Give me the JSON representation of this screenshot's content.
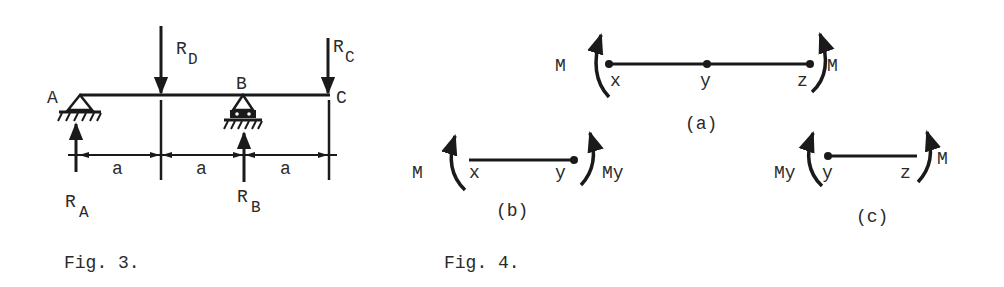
{
  "figure3": {
    "caption": "Fig. 3.",
    "points": {
      "A": "A",
      "B": "B",
      "C": "C"
    },
    "forces": {
      "RD": {
        "main": "R",
        "sub": "D"
      },
      "RC": {
        "main": "R",
        "sub": "C"
      },
      "RA": {
        "main": "R",
        "sub": "A"
      },
      "RB": {
        "main": "R",
        "sub": "B"
      }
    },
    "spans": [
      "a",
      "a",
      "a"
    ]
  },
  "figure4": {
    "caption": "Fig. 4.",
    "a": {
      "label": "(a)",
      "left_moment": "M",
      "right_moment": "M",
      "points": [
        "x",
        "y",
        "z"
      ]
    },
    "b": {
      "label": "(b)",
      "left_moment": "M",
      "right_moment": "My",
      "points": [
        "x",
        "y"
      ]
    },
    "c": {
      "label": "(c)",
      "left_moment": "My",
      "right_moment": "M",
      "points": [
        "y",
        "z"
      ]
    }
  }
}
